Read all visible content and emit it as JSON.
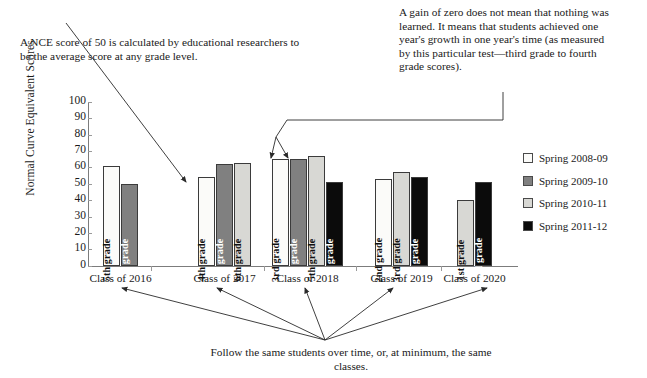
{
  "annotations": {
    "nce_note": "A NCE score of 50 is calculated by educational researchers to be the average score at any grade level.",
    "gain_note": "A gain of zero does not mean that nothing was learned. It means that students achieved one year's growth in one year's time (as measured by this particular test—third grade to fourth grade scores).",
    "caption": "Follow the same students over time, or, at minimum, the same classes."
  },
  "legend": {
    "items": [
      {
        "label": "Spring 2008-09",
        "color": "#fbfbf9"
      },
      {
        "label": "Spring 2009-10",
        "color": "#808080"
      },
      {
        "label": "Spring 2010-11",
        "color": "#d8d8d4"
      },
      {
        "label": "Spring 2011-12",
        "color": "#0b0b0b"
      }
    ]
  },
  "chart_data": {
    "type": "bar",
    "title": "",
    "xlabel": "",
    "ylabel": "Normal Curve Equivalent Scores",
    "ylim": [
      0,
      100
    ],
    "yticks": [
      100,
      90,
      80,
      70,
      60,
      50,
      40,
      30,
      20,
      10,
      0
    ],
    "grid": false,
    "legend_position": "right",
    "categories": [
      "Class of 2016",
      "Class of 2017",
      "Class of 2018",
      "Class of 2019",
      "Class of 2020"
    ],
    "series": [
      {
        "name": "Spring 2008-09",
        "color": "#fbfbf9",
        "text_color": "#111111",
        "values": [
          61,
          54,
          65,
          53,
          null
        ]
      },
      {
        "name": "Spring 2009-10",
        "color": "#808080",
        "text_color": "#ffffff",
        "values": [
          50,
          62,
          65,
          null,
          null
        ]
      },
      {
        "name": "Spring 2010-11",
        "color": "#d8d8d4",
        "text_color": "#111111",
        "values": [
          null,
          63,
          67,
          57,
          40
        ]
      },
      {
        "name": "Spring 2011-12",
        "color": "#0b0b0b",
        "text_color": "#ffffff",
        "values": [
          null,
          null,
          51,
          54,
          51
        ]
      }
    ],
    "groups": [
      {
        "category": "Class of 2016",
        "bars": [
          {
            "grade": "5th grade",
            "value": 61,
            "series": "Spring 2008-09",
            "color": "#fbfbf9",
            "text_color": "#111111"
          },
          {
            "grade": "6th grade",
            "value": 50,
            "series": "Spring 2009-10",
            "color": "#808080",
            "text_color": "#ffffff"
          }
        ]
      },
      {
        "category": "Class of 2017",
        "bars": [
          {
            "grade": "4th grade",
            "value": 54,
            "series": "Spring 2008-09",
            "color": "#fbfbf9",
            "text_color": "#111111"
          },
          {
            "grade": "5th grade",
            "value": 62,
            "series": "Spring 2009-10",
            "color": "#808080",
            "text_color": "#ffffff"
          },
          {
            "grade": "6th grade",
            "value": 63,
            "series": "Spring 2010-11",
            "color": "#d8d8d4",
            "text_color": "#111111"
          }
        ]
      },
      {
        "category": "Class of 2018",
        "bars": [
          {
            "grade": "3rd grade",
            "value": 65,
            "series": "Spring 2008-09",
            "color": "#fbfbf9",
            "text_color": "#111111"
          },
          {
            "grade": "4th grade",
            "value": 65,
            "series": "Spring 2009-10",
            "color": "#808080",
            "text_color": "#ffffff"
          },
          {
            "grade": "5th grade",
            "value": 67,
            "series": "Spring 2010-11",
            "color": "#d8d8d4",
            "text_color": "#111111"
          },
          {
            "grade": "6th grade",
            "value": 51,
            "series": "Spring 2011-12",
            "color": "#0b0b0b",
            "text_color": "#ffffff"
          }
        ]
      },
      {
        "category": "Class of 2019",
        "bars": [
          {
            "grade": "2nd grade",
            "value": 53,
            "series": "Spring 2008-09",
            "color": "#fbfbf9",
            "text_color": "#111111"
          },
          {
            "grade": "3rd grade",
            "value": 57,
            "series": "Spring 2010-11",
            "color": "#d8d8d4",
            "text_color": "#111111"
          },
          {
            "grade": "4th grade",
            "value": 54,
            "series": "Spring 2011-12",
            "color": "#0b0b0b",
            "text_color": "#ffffff"
          }
        ]
      },
      {
        "category": "Class of 2020",
        "bars": [
          {
            "grade": "1st grade",
            "value": 40,
            "series": "Spring 2010-11",
            "color": "#d8d8d4",
            "text_color": "#111111"
          },
          {
            "grade": "2nd grade",
            "value": 51,
            "series": "Spring 2011-12",
            "color": "#0b0b0b",
            "text_color": "#ffffff"
          }
        ]
      }
    ]
  }
}
